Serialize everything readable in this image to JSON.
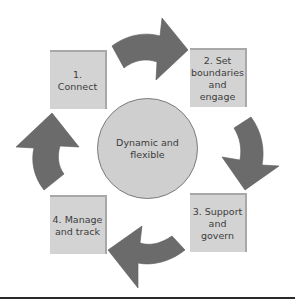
{
  "diagram": {
    "type": "cycle",
    "center": {
      "label": "Dynamic and flexible"
    },
    "steps": [
      {
        "label": "1. Connect"
      },
      {
        "label": "2. Set boundaries and engage"
      },
      {
        "label": "3. Support and govern"
      },
      {
        "label": "4. Manage and track"
      }
    ],
    "arrows": [
      {
        "from": "1. Connect",
        "to": "2. Set boundaries and engage",
        "direction": "clockwise"
      },
      {
        "from": "2. Set boundaries and engage",
        "to": "3. Support and govern",
        "direction": "clockwise"
      },
      {
        "from": "3. Support and govern",
        "to": "4. Manage and track",
        "direction": "clockwise"
      },
      {
        "from": "4. Manage and track",
        "to": "1. Connect",
        "direction": "clockwise"
      }
    ],
    "colors": {
      "box_fill": "#d3d3d3",
      "arrow_fill": "#6b6b6b",
      "circle_fill": "#cfcfcf",
      "rule": "#2a2a2a"
    }
  }
}
